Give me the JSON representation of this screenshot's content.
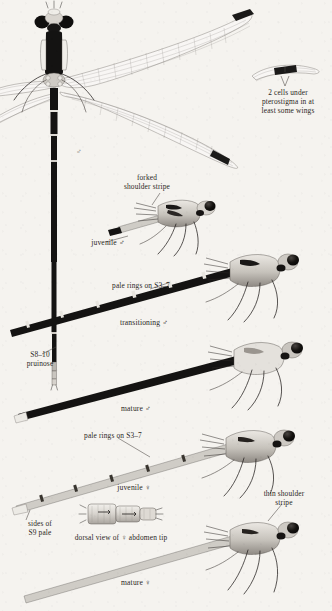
{
  "plate": {
    "subject": "damselfly-spreadwing-identification-plate",
    "background_color": "#f5f3ef",
    "ink_color": "#2b2724"
  },
  "annotations": {
    "pterostigma_note": "2 cells under\npterostigma in at\nleast some wings",
    "forked_shoulder_stripe": "forked\nshoulder stripe",
    "juvenile_male": "juvenile ♂",
    "pale_rings_male": "pale rings on S3–7",
    "transitioning_male": "transitioning ♂",
    "s8_10_pruinose": "S8–10\npruinose",
    "mature_male": "mature ♂",
    "pale_rings_female": "pale rings on S3–7",
    "juvenile_female": "juvenile ♀",
    "thin_shoulder_stripe": "thin shoulder\nstripe",
    "sides_of_s9_pale": "sides of\nS9 pale",
    "dorsal_abdomen_tip": "dorsal view of ♀ abdomen tip",
    "mature_female": "mature ♀",
    "top_specimen_sex": "♂"
  },
  "figures": [
    {
      "id": "dorsal-male-full",
      "name": "dorsal view of male with spread wings",
      "sex": "male"
    },
    {
      "id": "pterostigma-detail",
      "name": "wing tip pterostigma cell detail",
      "sex": ""
    },
    {
      "id": "juvenile-male",
      "name": "lateral view juvenile male",
      "sex": "male"
    },
    {
      "id": "transitioning-male",
      "name": "lateral view transitioning male",
      "sex": "male"
    },
    {
      "id": "mature-male",
      "name": "lateral view mature male",
      "sex": "male"
    },
    {
      "id": "juvenile-female",
      "name": "lateral view juvenile female",
      "sex": "female"
    },
    {
      "id": "female-abdomen-tip",
      "name": "dorsal view of female abdomen tip",
      "sex": "female"
    },
    {
      "id": "mature-female",
      "name": "lateral view mature female",
      "sex": "female"
    }
  ]
}
